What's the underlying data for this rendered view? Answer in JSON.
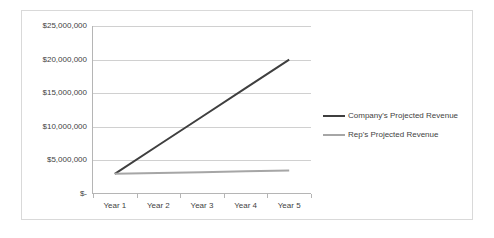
{
  "chart_data": {
    "type": "line",
    "title": "",
    "xlabel": "",
    "ylabel": "",
    "categories": [
      "Year 1",
      "Year 2",
      "Year 3",
      "Year 4",
      "Year 5"
    ],
    "series": [
      {
        "name": "Company's Projected Revenue",
        "color": "#3f3f3f",
        "values": [
          3000000,
          7250000,
          11500000,
          15750000,
          20000000
        ]
      },
      {
        "name": "Rep's Projected Revenue",
        "color": "#a6a6a6",
        "values": [
          3000000,
          3125000,
          3250000,
          3375000,
          3500000
        ]
      }
    ],
    "ylim": [
      0,
      25000000
    ],
    "ytick_values": [
      25000000,
      20000000,
      15000000,
      10000000,
      5000000,
      0
    ],
    "ytick_labels": [
      "$25,000,000",
      "$20,000,000",
      "$15,000,000",
      "$10,000,000",
      "$5,000,000",
      "$-"
    ],
    "grid": true,
    "legend_position": "right",
    "plot_background": "#ffffff",
    "gridline_color": "#d0d0d0",
    "axis_color": "#b5b5b5",
    "border_color": "#d9d9d9"
  }
}
